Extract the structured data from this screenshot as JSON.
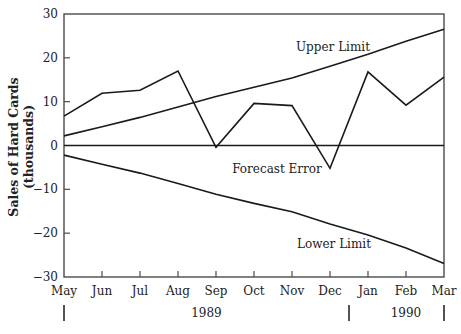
{
  "chart_data": {
    "type": "line",
    "title": "",
    "xlabel": "",
    "ylabel": "Sales of Hard Cards",
    "ylabel_sub": "(thousands)",
    "ylim": [
      -30,
      30
    ],
    "yticks": [
      30,
      20,
      10,
      0,
      -10,
      -20,
      -30
    ],
    "ytick_labels": [
      "30",
      "20",
      "10",
      "0",
      "−10",
      "−20",
      "−30"
    ],
    "grid": false,
    "legend": "none (series labeled inline)",
    "categories": [
      "May",
      "Jun",
      "Jul",
      "Aug",
      "Sep",
      "Oct",
      "Nov",
      "Dec",
      "Jan",
      "Feb",
      "Mar"
    ],
    "year_groups": [
      {
        "label": "1989",
        "from": "May",
        "to": "Dec"
      },
      {
        "label": "1990",
        "from": "Jan",
        "to": "Mar"
      }
    ],
    "series": [
      {
        "name": "Forecast Error",
        "values": [
          6.7,
          11.9,
          12.6,
          17.0,
          -0.4,
          9.6,
          9.1,
          -5.2,
          16.8,
          9.2,
          15.6
        ]
      },
      {
        "name": "Upper Limit",
        "values": [
          2.2,
          4.3,
          6.4,
          8.8,
          11.2,
          13.3,
          15.4,
          18.1,
          20.8,
          23.8,
          26.5
        ]
      },
      {
        "name": "Lower Limit",
        "values": [
          -2.2,
          -4.3,
          -6.3,
          -8.7,
          -11.1,
          -13.2,
          -15.1,
          -17.9,
          -20.4,
          -23.4,
          -26.9
        ]
      },
      {
        "name": "Zero Line",
        "values": [
          0,
          0,
          0,
          0,
          0,
          0,
          0,
          0,
          0,
          0,
          0
        ]
      }
    ],
    "annotations": [
      {
        "text": "Upper Limit",
        "x": 333,
        "y": 51
      },
      {
        "text": "Forecast Error",
        "x": 277,
        "y": 173
      },
      {
        "text": "Lower Limit",
        "x": 334,
        "y": 248
      }
    ]
  },
  "colors": {
    "line": "#1a1a1a",
    "frame": "#4a4a4a",
    "text": "#222222",
    "background": "#ffffff"
  }
}
